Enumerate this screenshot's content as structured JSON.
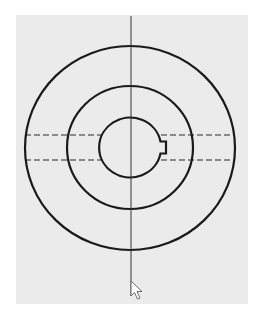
{
  "drawing": {
    "view": "front-view",
    "background_color": "#ebebeb",
    "stroke_color": "#1a1a1a",
    "centerline_color": "#333333",
    "center": {
      "x": 130,
      "y": 148
    },
    "circles": [
      {
        "name": "outer-circle",
        "rx": 105,
        "ry": 102
      },
      {
        "name": "middle-circle",
        "rx": 63,
        "ry": 61.5
      },
      {
        "name": "inner-bore-circle",
        "rx": 31,
        "ry": 30
      }
    ],
    "hidden_lines_y": [
      135,
      160
    ],
    "hidden_lines_x": [
      25,
      235
    ],
    "keyway": {
      "x_start": 160,
      "x_end": 166,
      "y_top": 141,
      "y_bottom": 153
    },
    "vertical_centerline": {
      "x": 131,
      "y_start": 16,
      "y_end": 296
    }
  },
  "cursor": {
    "icon": "mouse-pointer-arrow",
    "x": 131,
    "y": 281
  }
}
